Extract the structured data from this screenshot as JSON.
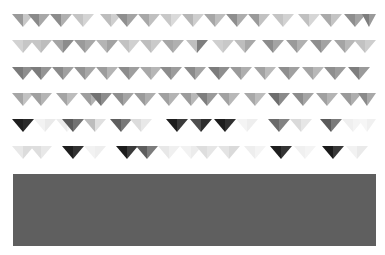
{
  "canvas": {
    "width": 385,
    "height": 255,
    "background": "#ffffff"
  },
  "pattern": {
    "left": 12,
    "right": 376,
    "row_height": 13,
    "rows": [
      {
        "y": 14,
        "pennants": [
          {
            "x": 12,
            "w": 22,
            "l": "#9a9a9a",
            "r": "#c8c8c8"
          },
          {
            "x": 28,
            "w": 22,
            "l": "#8a8a8a",
            "r": "#a8a8a8"
          },
          {
            "x": 50,
            "w": 22,
            "l": "#8c8c8c",
            "r": "#b0b0b0"
          },
          {
            "x": 72,
            "w": 22,
            "l": "#c4c4c4",
            "r": "#d4d4d4"
          },
          {
            "x": 100,
            "w": 22,
            "l": "#bdbdbd",
            "r": "#cfcfcf"
          },
          {
            "x": 116,
            "w": 22,
            "l": "#8f8f8f",
            "r": "#a4a4a4"
          },
          {
            "x": 138,
            "w": 22,
            "l": "#a8a8a8",
            "r": "#c0c0c0"
          },
          {
            "x": 160,
            "w": 22,
            "l": "#c8c8c8",
            "r": "#dadada"
          },
          {
            "x": 182,
            "w": 22,
            "l": "#b6b6b6",
            "r": "#cecece"
          },
          {
            "x": 204,
            "w": 22,
            "l": "#a6a6a6",
            "r": "#bdbdbd"
          },
          {
            "x": 226,
            "w": 22,
            "l": "#8e8e8e",
            "r": "#adadad"
          },
          {
            "x": 248,
            "w": 22,
            "l": "#9a9a9a",
            "r": "#c2c2c2"
          },
          {
            "x": 272,
            "w": 22,
            "l": "#c4c4c4",
            "r": "#d2d2d2"
          },
          {
            "x": 298,
            "w": 22,
            "l": "#c0c0c0",
            "r": "#d6d6d6"
          },
          {
            "x": 320,
            "w": 22,
            "l": "#aaaaaa",
            "r": "#c4c4c4"
          },
          {
            "x": 344,
            "w": 22,
            "l": "#8e8e8e",
            "r": "#a2a2a2"
          },
          {
            "x": 362,
            "w": 14,
            "l": "#7e7e7e",
            "r": "#9a9a9a"
          }
        ]
      },
      {
        "y": 40,
        "pennants": [
          {
            "x": 12,
            "w": 22,
            "l": "#d2d2d2",
            "r": "#c6c6c6"
          },
          {
            "x": 30,
            "w": 22,
            "l": "#c6c6c6",
            "r": "#bdbdbd"
          },
          {
            "x": 52,
            "w": 22,
            "l": "#a4a4a4",
            "r": "#8c8c8c"
          },
          {
            "x": 74,
            "w": 22,
            "l": "#9a9a9a",
            "r": "#a8a8a8"
          },
          {
            "x": 96,
            "w": 22,
            "l": "#b4b4b4",
            "r": "#a2a2a2"
          },
          {
            "x": 118,
            "w": 22,
            "l": "#c2c2c2",
            "r": "#d0d0d0"
          },
          {
            "x": 140,
            "w": 22,
            "l": "#bebebe",
            "r": "#cacaca"
          },
          {
            "x": 162,
            "w": 22,
            "l": "#a6a6a6",
            "r": "#b0b0b0"
          },
          {
            "x": 186,
            "w": 22,
            "l": "#bfbfbf",
            "r": "#7e7e7e"
          },
          {
            "x": 212,
            "w": 22,
            "l": "#cfcfcf",
            "r": "#c8c8c8"
          },
          {
            "x": 234,
            "w": 22,
            "l": "#bdbdbd",
            "r": "#a8a8a8"
          },
          {
            "x": 262,
            "w": 22,
            "l": "#8c8c8c",
            "r": "#a4a4a4"
          },
          {
            "x": 286,
            "w": 22,
            "l": "#9a9a9a",
            "r": "#b0b0b0"
          },
          {
            "x": 310,
            "w": 22,
            "l": "#8e8e8e",
            "r": "#a2a2a2"
          },
          {
            "x": 334,
            "w": 22,
            "l": "#a4a4a4",
            "r": "#b8b8b8"
          },
          {
            "x": 354,
            "w": 22,
            "l": "#c2c2c2",
            "r": "#cecece"
          }
        ]
      },
      {
        "y": 67,
        "pennants": [
          {
            "x": 12,
            "w": 22,
            "l": "#7a7a7a",
            "r": "#8e8e8e"
          },
          {
            "x": 30,
            "w": 22,
            "l": "#7c7c7c",
            "r": "#949494"
          },
          {
            "x": 52,
            "w": 22,
            "l": "#8a8a8a",
            "r": "#a0a0a0"
          },
          {
            "x": 74,
            "w": 22,
            "l": "#929292",
            "r": "#a6a6a6"
          },
          {
            "x": 96,
            "w": 22,
            "l": "#9c9c9c",
            "r": "#b4b4b4"
          },
          {
            "x": 118,
            "w": 22,
            "l": "#8c8c8c",
            "r": "#9e9e9e"
          },
          {
            "x": 140,
            "w": 22,
            "l": "#a8a8a8",
            "r": "#b6b6b6"
          },
          {
            "x": 160,
            "w": 22,
            "l": "#8c8c8c",
            "r": "#9c9c9c"
          },
          {
            "x": 184,
            "w": 22,
            "l": "#8a8a8a",
            "r": "#a4a4a4"
          },
          {
            "x": 208,
            "w": 22,
            "l": "#7c7c7c",
            "r": "#8e8e8e"
          },
          {
            "x": 230,
            "w": 22,
            "l": "#9a9a9a",
            "r": "#aeaeae"
          },
          {
            "x": 254,
            "w": 22,
            "l": "#a2a2a2",
            "r": "#bababa"
          },
          {
            "x": 278,
            "w": 22,
            "l": "#8e8e8e",
            "r": "#a0a0a0"
          },
          {
            "x": 302,
            "w": 22,
            "l": "#a4a4a4",
            "r": "#b8b8b8"
          },
          {
            "x": 324,
            "w": 22,
            "l": "#8e8e8e",
            "r": "#9c9c9c"
          },
          {
            "x": 348,
            "w": 22,
            "l": "#7e7e7e",
            "r": "#9a9a9a"
          }
        ]
      },
      {
        "y": 93,
        "pennants": [
          {
            "x": 12,
            "w": 22,
            "l": "#a6a6a6",
            "r": "#c2c2c2"
          },
          {
            "x": 30,
            "w": 22,
            "l": "#a0a0a0",
            "r": "#b4b4b4"
          },
          {
            "x": 56,
            "w": 22,
            "l": "#a4a4a4",
            "r": "#bcbcbc"
          },
          {
            "x": 80,
            "w": 22,
            "l": "#9e9e9e",
            "r": "#b2b2b2"
          },
          {
            "x": 90,
            "w": 22,
            "l": "#727272",
            "r": "#8c8c8c"
          },
          {
            "x": 112,
            "w": 22,
            "l": "#8e8e8e",
            "r": "#a4a4a4"
          },
          {
            "x": 134,
            "w": 22,
            "l": "#9a9a9a",
            "r": "#adadad"
          },
          {
            "x": 158,
            "w": 22,
            "l": "#a0a0a0",
            "r": "#b4b4b4"
          },
          {
            "x": 180,
            "w": 22,
            "l": "#9c9c9c",
            "r": "#b8b8b8"
          },
          {
            "x": 196,
            "w": 22,
            "l": "#7e7e7e",
            "r": "#9a9a9a"
          },
          {
            "x": 218,
            "w": 22,
            "l": "#a2a2a2",
            "r": "#b8b8b8"
          },
          {
            "x": 244,
            "w": 22,
            "l": "#a8a8a8",
            "r": "#bcbcbc"
          },
          {
            "x": 268,
            "w": 22,
            "l": "#6e6e6e",
            "r": "#8a8a8a"
          },
          {
            "x": 292,
            "w": 22,
            "l": "#8c8c8c",
            "r": "#a4a4a4"
          },
          {
            "x": 316,
            "w": 22,
            "l": "#a0a0a0",
            "r": "#b4b4b4"
          },
          {
            "x": 340,
            "w": 22,
            "l": "#9a9a9a",
            "r": "#aeaeae"
          },
          {
            "x": 358,
            "w": 18,
            "l": "#8a8a8a",
            "r": "#a8a8a8"
          }
        ]
      },
      {
        "y": 119,
        "pennants": [
          {
            "x": 12,
            "w": 22,
            "l": "#1e1e1e",
            "r": "#2a2a2a"
          },
          {
            "x": 34,
            "w": 22,
            "l": "#f2f2f2",
            "r": "#eaeaea"
          },
          {
            "x": 56,
            "w": 22,
            "l": "#ececec",
            "r": "#f4f4f4"
          },
          {
            "x": 62,
            "w": 22,
            "l": "#5a5a5a",
            "r": "#727272"
          },
          {
            "x": 84,
            "w": 22,
            "l": "#bdbdbd",
            "r": "#e0e0e0"
          },
          {
            "x": 110,
            "w": 22,
            "l": "#5e5e5e",
            "r": "#787878"
          },
          {
            "x": 130,
            "w": 22,
            "l": "#dcdcdc",
            "r": "#e8e8e8"
          },
          {
            "x": 166,
            "w": 22,
            "l": "#1e1e1e",
            "r": "#3a3a3a"
          },
          {
            "x": 190,
            "w": 22,
            "l": "#4e4e4e",
            "r": "#2e2e2e"
          },
          {
            "x": 214,
            "w": 22,
            "l": "#1c1c1c",
            "r": "#303030"
          },
          {
            "x": 236,
            "w": 22,
            "l": "#f4f4f4",
            "r": "#eeeeee"
          },
          {
            "x": 268,
            "w": 22,
            "l": "#6a6a6a",
            "r": "#828282"
          },
          {
            "x": 290,
            "w": 22,
            "l": "#dadada",
            "r": "#e6e6e6"
          },
          {
            "x": 320,
            "w": 22,
            "l": "#5a5a5a",
            "r": "#7a7a7a"
          },
          {
            "x": 342,
            "w": 22,
            "l": "#efefef",
            "r": "#f4f4f4"
          },
          {
            "x": 358,
            "w": 18,
            "l": "#f6f6f6",
            "r": "#f0f0f0"
          }
        ]
      },
      {
        "y": 146,
        "pennants": [
          {
            "x": 12,
            "w": 22,
            "l": "#e8e8e8",
            "r": "#dcdcdc"
          },
          {
            "x": 30,
            "w": 22,
            "l": "#dedede",
            "r": "#e8e8e8"
          },
          {
            "x": 62,
            "w": 22,
            "l": "#1e1e1e",
            "r": "#323232"
          },
          {
            "x": 84,
            "w": 22,
            "l": "#f2f2f2",
            "r": "#eeeeee"
          },
          {
            "x": 116,
            "w": 22,
            "l": "#1c1c1c",
            "r": "#3a3a3a"
          },
          {
            "x": 136,
            "w": 22,
            "l": "#5e5e5e",
            "r": "#7c7c7c"
          },
          {
            "x": 158,
            "w": 22,
            "l": "#e8e8e8",
            "r": "#f0f0f0"
          },
          {
            "x": 180,
            "w": 22,
            "l": "#f2f2f2",
            "r": "#ececec"
          },
          {
            "x": 196,
            "w": 22,
            "l": "#dedede",
            "r": "#e6e6e6"
          },
          {
            "x": 218,
            "w": 22,
            "l": "#e4e4e4",
            "r": "#dadada"
          },
          {
            "x": 244,
            "w": 22,
            "l": "#eeeeee",
            "r": "#f4f4f4"
          },
          {
            "x": 270,
            "w": 22,
            "l": "#1e1e1e",
            "r": "#343434"
          },
          {
            "x": 294,
            "w": 22,
            "l": "#f0f0f0",
            "r": "#f4f4f4"
          },
          {
            "x": 322,
            "w": 22,
            "l": "#1a1a1a",
            "r": "#383838"
          },
          {
            "x": 346,
            "w": 22,
            "l": "#f2f2f2",
            "r": "#eaeaea"
          }
        ]
      }
    ]
  },
  "block": {
    "x": 13,
    "y": 174,
    "w": 363,
    "h": 72,
    "color": "#5f5f5f"
  }
}
